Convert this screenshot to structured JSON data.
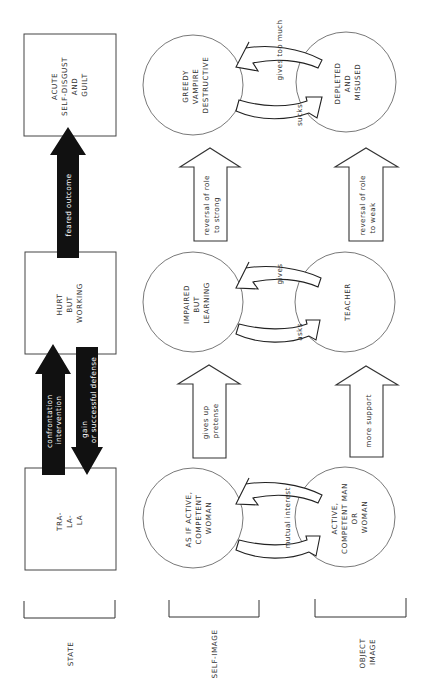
{
  "diagram": {
    "orientation": "rotated 90 degrees counter-clockwise (text reads bottom-to-top)",
    "columns": {
      "state": {
        "label": "STATE",
        "boxes": [
          {
            "lines": [
              "ACUTE",
              "SELF-DISGUST",
              "AND",
              "GUILT"
            ]
          },
          {
            "lines": [
              "HURT",
              "BUT",
              "WORKING"
            ]
          },
          {
            "lines": [
              "TRA-",
              "LA-",
              "LA"
            ]
          }
        ],
        "arrows": [
          {
            "lines": [
              "feared outcome"
            ],
            "direction": "toward ACUTE SELF-DISGUST AND GUILT",
            "style": "solid-black"
          },
          {
            "lines": [
              "confrontation",
              "intervention"
            ],
            "direction": "toward HURT BUT WORKING",
            "style": "solid-black"
          },
          {
            "lines": [
              "gain",
              "or successful defense"
            ],
            "direction": "toward TRA-LA-LA",
            "style": "solid-black"
          }
        ]
      },
      "self_image": {
        "label": "SELF-IMAGE",
        "circles": [
          {
            "lines": [
              "GREEDY",
              "VAMPIRE",
              "DESTRUCTIVE"
            ]
          },
          {
            "lines": [
              "IMPAIRED",
              "BUT",
              "LEARNING"
            ]
          },
          {
            "lines": [
              "AS IF ACTIVE,",
              "COMPETENT",
              "WOMAN"
            ]
          }
        ],
        "arrows": [
          {
            "lines": [
              "reversal of role",
              "to strong"
            ],
            "style": "hollow"
          },
          {
            "lines": [
              "gives up",
              "pretense"
            ],
            "style": "hollow"
          }
        ]
      },
      "object_image": {
        "label_lines": [
          "OBJECT",
          "IMAGE"
        ],
        "circles": [
          {
            "lines": [
              "DEPLETED",
              "AND",
              "MISUSED"
            ]
          },
          {
            "lines": [
              "TEACHER"
            ]
          },
          {
            "lines": [
              "ACTIVE,",
              "COMPETENT MAN",
              "OR",
              "WOMAN"
            ]
          }
        ],
        "arrows": [
          {
            "lines": [
              "reversal of role",
              "to weak"
            ],
            "style": "hollow"
          },
          {
            "lines": [
              "more support"
            ],
            "style": "hollow"
          }
        ]
      }
    },
    "exchanges": [
      {
        "top": "gives too much",
        "bottom": "sucks"
      },
      {
        "top": "gives",
        "bottom": "asks"
      },
      {
        "middle": "mutual interest"
      }
    ]
  }
}
